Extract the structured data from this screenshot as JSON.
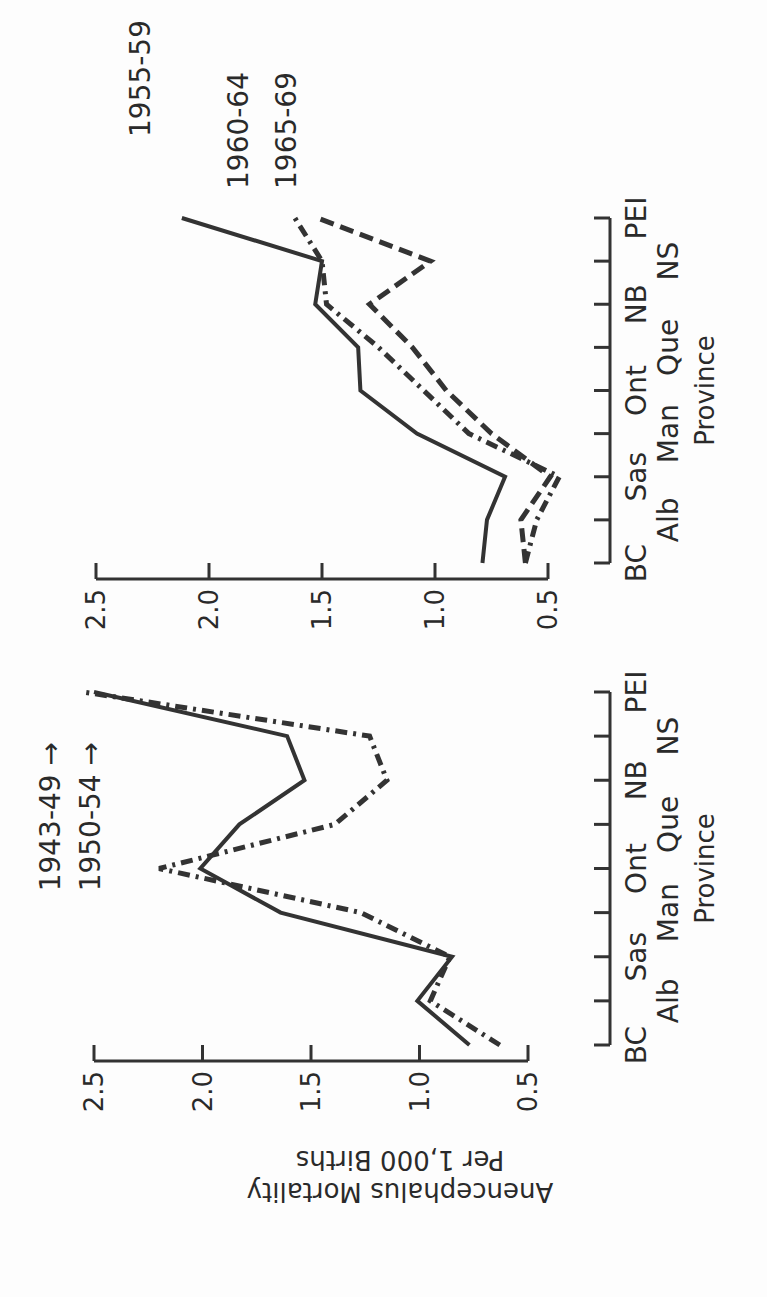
{
  "figure": {
    "ylabel_line1": "Anencephalus Mortality",
    "ylabel_line2": "Per 1,000 Births",
    "xlabel": "Province"
  },
  "colors": {
    "ink": "#333333",
    "background": "#fdfdfd"
  },
  "chart_data": [
    {
      "type": "line",
      "title": "",
      "xlabel": "Province",
      "ylabel": "Anencephalus Mortality Per 1,000 Births",
      "ylim": [
        0.5,
        2.5
      ],
      "yticks": [
        "0.5",
        "1.0",
        "1.5",
        "2.0",
        "2.5"
      ],
      "grid": false,
      "categories": [
        "BC",
        "Alb",
        "Sas",
        "Man",
        "Ont",
        "Que",
        "NB",
        "NS",
        "PEI"
      ],
      "series": [
        {
          "name": "1943-49",
          "style": "dash-dot",
          "values": [
            0.63,
            0.95,
            0.86,
            1.27,
            2.2,
            1.39,
            1.15,
            1.23,
            2.55
          ],
          "annotation": "off-scale at PEI (arrow)"
        },
        {
          "name": "1950-54",
          "style": "solid",
          "values": [
            0.77,
            1.01,
            0.85,
            1.64,
            2.01,
            1.83,
            1.53,
            1.61,
            2.5
          ],
          "annotation": "off-scale at PEI (arrow)"
        }
      ]
    },
    {
      "type": "line",
      "title": "",
      "xlabel": "Province",
      "ylabel": "Anencephalus Mortality Per 1,000 Births",
      "ylim": [
        0.5,
        2.5
      ],
      "yticks": [
        "0.5",
        "1.0",
        "1.5",
        "2.0",
        "2.5"
      ],
      "grid": false,
      "categories": [
        "BC",
        "Alb",
        "Sas",
        "Man",
        "Ont",
        "Que",
        "NB",
        "NS",
        "PEI"
      ],
      "series": [
        {
          "name": "1955-59",
          "style": "solid",
          "values": [
            0.79,
            0.77,
            0.69,
            1.08,
            1.33,
            1.34,
            1.53,
            1.5,
            2.12
          ]
        },
        {
          "name": "1960-64",
          "style": "dash-dot",
          "values": [
            0.6,
            0.55,
            0.45,
            0.85,
            1.05,
            1.25,
            1.48,
            1.5,
            1.62
          ]
        },
        {
          "name": "1965-69",
          "style": "dashed",
          "values": [
            0.6,
            0.62,
            0.49,
            0.75,
            0.95,
            1.1,
            1.29,
            1.02,
            1.52
          ]
        }
      ]
    }
  ],
  "panels": [
    {
      "series_labels": [
        {
          "text": "1943-49",
          "arrow": true
        },
        {
          "text": "1950-54",
          "arrow": true
        }
      ],
      "row1": [
        "BC",
        "Sas",
        "Ont",
        "NB",
        "PEI"
      ],
      "row2": [
        "Alb",
        "Man",
        "Que",
        "NS"
      ]
    },
    {
      "series_labels": [
        {
          "text": "1955-59",
          "arrow": false
        },
        {
          "text": "1960-64",
          "arrow": false
        },
        {
          "text": "1965-69",
          "arrow": false
        }
      ],
      "row1": [
        "BC",
        "Sas",
        "Ont",
        "NB",
        "PEI"
      ],
      "row2": [
        "Alb",
        "Man",
        "Que",
        "NS"
      ]
    }
  ]
}
